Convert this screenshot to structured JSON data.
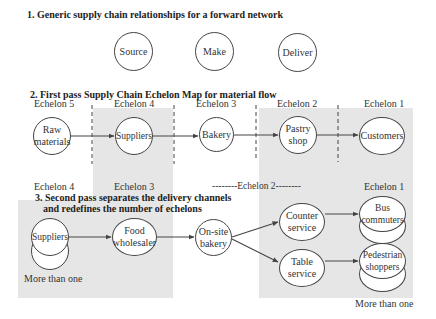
{
  "section1": {
    "heading": "1. Generic supply chain relationships for a forward network",
    "nodes": [
      "Source",
      "Make",
      "Deliver"
    ]
  },
  "section2": {
    "heading": "2. First pass Supply Chain Echelon Map for material flow",
    "echelons": [
      "Echelon 5",
      "Echelon 4",
      "Echelon 3",
      "Echelon 2",
      "Echelon 1"
    ],
    "nodes": [
      "Raw materials",
      "Suppliers",
      "Bakery",
      "Pastry shop",
      "Customers"
    ]
  },
  "section3": {
    "heading_line1": "3. Second pass separates the delivery channels",
    "heading_line2": "and redefines the number of echelons",
    "echelons": [
      "Echelon 4",
      "Echelon 3",
      "--------Echelon 2--------",
      "Echelon 1"
    ],
    "nodes": {
      "suppliers": "Suppliers",
      "food_wholesaler": "Food wholesaler",
      "onsite_bakery": "On-site bakery",
      "counter_service": "Counter service",
      "table_service": "Table service",
      "bus_commuters": "Bus commuters",
      "pedestrian_shoppers": "Pedestrian shoppers"
    },
    "notes": {
      "suppliers_multiple": "More than one",
      "customers_multiple": "More than one"
    }
  },
  "colors": {
    "shade": "#e6e6e6",
    "stroke": "#444444",
    "text": "#333333"
  }
}
